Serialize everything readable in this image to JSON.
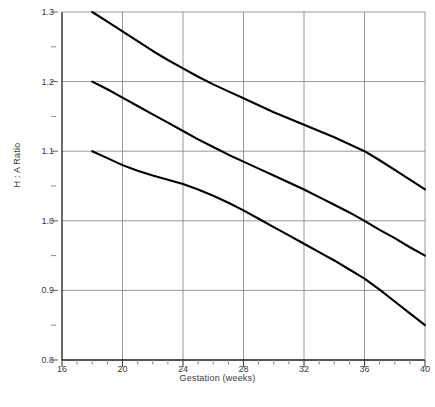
{
  "chart_data": {
    "type": "line",
    "title": "",
    "xlabel": "Gestation (weeks)",
    "ylabel": "H : A Ratio",
    "xlim": [
      16,
      40
    ],
    "ylim": [
      0.8,
      1.3
    ],
    "grid": true,
    "legend": "none",
    "x_major_ticks": [
      16,
      20,
      24,
      28,
      32,
      36,
      40
    ],
    "x_major_tick_labels": [
      "16",
      "20",
      "24",
      "28",
      "32",
      "36",
      "40"
    ],
    "x_minor_tick_step": 1,
    "y_major_ticks": [
      0.8,
      0.9,
      1.0,
      1.1,
      1.2,
      1.3
    ],
    "y_major_tick_labels": [
      "0.8",
      "0.9",
      "1.0",
      "1.1",
      "1.2",
      "1.3"
    ],
    "y_minor_ticks": [
      0.85,
      0.95,
      1.05,
      1.15,
      1.25
    ],
    "x_gridlines": [
      20,
      24,
      28,
      32,
      36
    ],
    "y_gridlines": [
      0.9,
      1.0,
      1.1,
      1.2
    ],
    "line_color": "#000000",
    "line_width": 2.1,
    "grid_color": "#8c8c8c",
    "axis_color": "#1a1a1a",
    "x": [
      18,
      19,
      20,
      21,
      22,
      23,
      24,
      25,
      26,
      27,
      28,
      29,
      30,
      31,
      32,
      33,
      34,
      35,
      36,
      37,
      38,
      39,
      40
    ],
    "series": [
      {
        "name": "upper",
        "values": [
          1.3,
          1.286,
          1.272,
          1.258,
          1.244,
          1.231,
          1.219,
          1.207,
          1.196,
          1.186,
          1.176,
          1.166,
          1.156,
          1.147,
          1.138,
          1.129,
          1.12,
          1.11,
          1.1,
          1.087,
          1.073,
          1.059,
          1.045
        ]
      },
      {
        "name": "median",
        "values": [
          1.2,
          1.189,
          1.177,
          1.165,
          1.153,
          1.141,
          1.129,
          1.117,
          1.106,
          1.095,
          1.085,
          1.075,
          1.065,
          1.055,
          1.045,
          1.034,
          1.023,
          1.012,
          1.0,
          0.987,
          0.975,
          0.962,
          0.95
        ]
      },
      {
        "name": "lower",
        "values": [
          1.1,
          1.09,
          1.08,
          1.072,
          1.065,
          1.059,
          1.053,
          1.045,
          1.036,
          1.026,
          1.015,
          1.003,
          0.991,
          0.979,
          0.967,
          0.955,
          0.943,
          0.93,
          0.917,
          0.901,
          0.884,
          0.867,
          0.85
        ]
      }
    ]
  },
  "caption": ""
}
